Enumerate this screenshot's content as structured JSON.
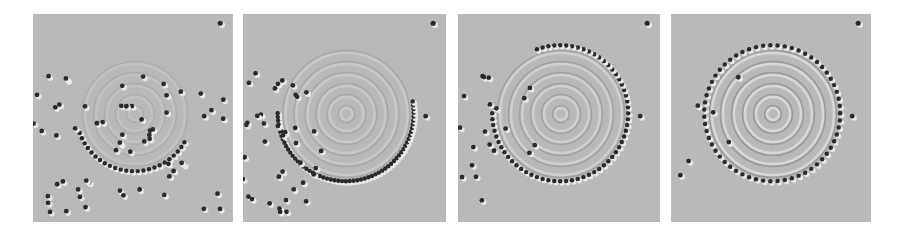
{
  "figure": {
    "panels": [
      {
        "id": 1,
        "stage": "partial arc, scattered atoms",
        "left": 33,
        "width": 200,
        "arc_start": 200,
        "arc_end": 330
      },
      {
        "id": 2,
        "stage": "half ring",
        "left": 243,
        "width": 203,
        "arc_start": 180,
        "arc_end": 370
      },
      {
        "id": 3,
        "stage": "nearly complete ring",
        "left": 458,
        "width": 202,
        "arc_start": 175,
        "arc_end": 470
      },
      {
        "id": 4,
        "stage": "complete ring corral",
        "left": 671,
        "width": 200,
        "arc_start": 0,
        "arc_end": 360
      }
    ],
    "colors": {
      "background": "#b9b9b9",
      "atom": "#2a2a2a",
      "highlight": "#e6e6e6"
    }
  }
}
